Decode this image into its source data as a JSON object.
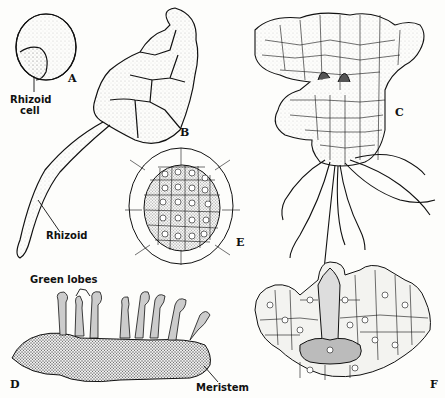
{
  "figure": {
    "panels": [
      {
        "id": "A",
        "letter": "A",
        "labels": [
          "Rhizoid cell"
        ]
      },
      {
        "id": "B",
        "letter": "B",
        "labels": [
          "Rhizoid"
        ]
      },
      {
        "id": "C",
        "letter": "C",
        "labels": []
      },
      {
        "id": "D",
        "letter": "D",
        "labels": [
          "Green lobes",
          "Meristem"
        ]
      },
      {
        "id": "E",
        "letter": "E",
        "labels": []
      },
      {
        "id": "F",
        "letter": "F",
        "labels": []
      }
    ],
    "labels": {
      "rhizoid_cell_line1": "Rhizoid",
      "rhizoid_cell_line2": "cell",
      "rhizoid": "Rhizoid",
      "green_lobes": "Green lobes",
      "meristem": "Meristem"
    },
    "colors": {
      "ink": "#111111",
      "paper": "#fdfdfb",
      "stipple": "#9a9a9a"
    }
  }
}
